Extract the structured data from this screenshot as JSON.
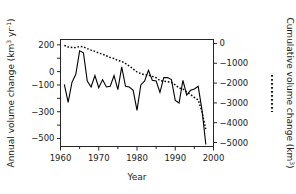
{
  "chart_data": {
    "type": "line",
    "title": "",
    "xlabel": "Year",
    "ylabel_left": "Annual volume change (km3 yr-1)",
    "ylabel_right": "Cumulative volume change (km3)",
    "xlim": [
      1960,
      2000
    ],
    "ylim_left": [
      -560,
      240
    ],
    "ylim_right": [
      -5200,
      200
    ],
    "x_ticks": [
      1960,
      1970,
      1980,
      1990,
      2000
    ],
    "x_tick_labels": [
      "1960",
      "1970",
      "1980",
      "1990",
      "2000"
    ],
    "x_minor_ticks": [
      1965,
      1975,
      1985,
      1995
    ],
    "y_left_ticks": [
      200,
      100,
      0,
      -100,
      -200,
      -300,
      -400,
      -500
    ],
    "y_left_tick_labels": [
      "200",
      "",
      "0",
      "-100",
      "",
      "-300",
      "",
      "-500"
    ],
    "y_right_ticks": [
      0,
      -1000,
      -2000,
      -3000,
      -4000,
      -5000
    ],
    "y_right_tick_labels": [
      "0",
      "-1000",
      "-2000",
      "-3000",
      "-4000",
      "-5000"
    ],
    "grid": false,
    "legend_position": "right-axis-title",
    "series": [
      {
        "name": "Annual volume change",
        "style": "solid",
        "axis": "left",
        "color": "#000000",
        "x": [
          1961,
          1962,
          1963,
          1964,
          1965,
          1966,
          1967,
          1968,
          1969,
          1970,
          1971,
          1972,
          1973,
          1974,
          1975,
          1976,
          1977,
          1978,
          1979,
          1980,
          1981,
          1982,
          1983,
          1984,
          1985,
          1986,
          1987,
          1988,
          1989,
          1990,
          1991,
          1992,
          1993,
          1994,
          1995,
          1996,
          1997,
          1998
        ],
        "values": [
          -95,
          -230,
          -80,
          -20,
          155,
          140,
          -70,
          -115,
          -30,
          -120,
          -60,
          -115,
          -110,
          -30,
          -135,
          35,
          -110,
          -115,
          -140,
          -290,
          -100,
          -70,
          10,
          -65,
          -70,
          -155,
          -45,
          -45,
          -60,
          -215,
          -235,
          -65,
          -175,
          -140,
          -130,
          -110,
          -290,
          -545
        ]
      },
      {
        "name": "Cumulative volume change",
        "style": "dotted",
        "axis": "right",
        "color": "#000000",
        "x": [
          1961,
          1962,
          1963,
          1964,
          1965,
          1966,
          1967,
          1968,
          1969,
          1970,
          1971,
          1972,
          1973,
          1974,
          1975,
          1976,
          1977,
          1978,
          1979,
          1980,
          1981,
          1982,
          1983,
          1984,
          1985,
          1986,
          1987,
          1988,
          1989,
          1990,
          1991,
          1992,
          1993,
          1994,
          1995,
          1996,
          1997,
          1998
        ],
        "values": [
          -95,
          -180,
          -200,
          -210,
          -150,
          -170,
          -260,
          -340,
          -400,
          -480,
          -540,
          -620,
          -710,
          -760,
          -860,
          -900,
          -1010,
          -1140,
          -1290,
          -1440,
          -1520,
          -1580,
          -1600,
          -1660,
          -1730,
          -1870,
          -1900,
          -1930,
          -1960,
          -2090,
          -2250,
          -2300,
          -2450,
          -2580,
          -2720,
          -2850,
          -3450,
          -4350
        ]
      }
    ]
  },
  "axis_labels": {
    "left_title_main": "Annual volume change (km",
    "left_title_sup1": "3",
    "left_title_mid": " yr",
    "left_title_sup2": "-1",
    "left_title_end": ")",
    "right_title_main": "Cumulative volume change (km",
    "right_title_sup": "3",
    "right_title_end": ")",
    "x_title": "Year"
  },
  "legend": {
    "dotted_marker_name": "dotted-line-legend-swatch"
  }
}
